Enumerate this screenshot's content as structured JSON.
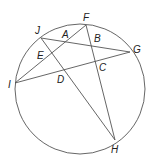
{
  "diagram": {
    "type": "circle-chords",
    "stroke_color": "#555555",
    "label_color": "#222222",
    "circle": {
      "cx": 80,
      "cy": 89,
      "r": 65
    },
    "points": {
      "F": {
        "x": 86,
        "y": 25,
        "label": "F",
        "lx": 83,
        "ly": 21
      },
      "J": {
        "x": 41,
        "y": 38,
        "label": "J",
        "lx": 35,
        "ly": 34
      },
      "G": {
        "x": 130,
        "y": 52,
        "label": "G",
        "lx": 133,
        "ly": 53
      },
      "I": {
        "x": 15,
        "y": 83,
        "label": "I",
        "lx": 8,
        "ly": 88
      },
      "H": {
        "x": 115,
        "y": 140,
        "label": "H",
        "lx": 111,
        "ly": 153
      },
      "A": {
        "label": "A",
        "lx": 62,
        "ly": 38
      },
      "B": {
        "label": "B",
        "lx": 94,
        "ly": 42
      },
      "C": {
        "label": "C",
        "lx": 99,
        "ly": 71
      },
      "D": {
        "label": "D",
        "lx": 57,
        "ly": 83
      },
      "E": {
        "label": "E",
        "lx": 37,
        "ly": 59
      }
    },
    "chords": [
      {
        "name": "chord-JG",
        "from": "J",
        "to": "G"
      },
      {
        "name": "chord-IG",
        "from": "I",
        "to": "G"
      },
      {
        "name": "chord-IF",
        "from": "I",
        "to": "F"
      },
      {
        "name": "chord-JH",
        "from": "J",
        "to": "H"
      },
      {
        "name": "chord-FH",
        "from": "F",
        "to": "H"
      }
    ]
  }
}
